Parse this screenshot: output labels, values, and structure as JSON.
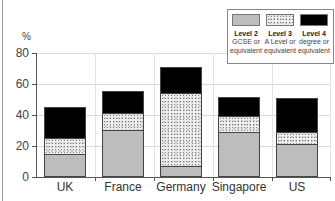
{
  "chart_data": {
    "type": "bar",
    "stacked": true,
    "title": "",
    "xlabel": "",
    "ylabel": "%",
    "ylim": [
      0,
      80
    ],
    "yticks": [
      0,
      20,
      40,
      60,
      80
    ],
    "grid": true,
    "legend_position": "top-right",
    "categories": [
      "UK",
      "France",
      "Germany",
      "Singapore",
      "US"
    ],
    "series": [
      {
        "name": "Level 2 GCSE or equivalent",
        "values": [
          15,
          30,
          7,
          29,
          21
        ],
        "color": "#bdbdbd",
        "pattern": "solid"
      },
      {
        "name": "Level 3 A Level or equivalent",
        "values": [
          10,
          11,
          47,
          10,
          8
        ],
        "color": "#eeeeee",
        "pattern": "stipple"
      },
      {
        "name": "Level 4 degree or equivalent",
        "values": [
          20,
          14,
          17,
          12,
          22
        ],
        "color": "#000000",
        "pattern": "solid"
      }
    ]
  },
  "axis": {
    "unit": "%",
    "yticks": [
      "0",
      "20",
      "40",
      "60",
      "80"
    ]
  },
  "legend": [
    {
      "title": "Level 2",
      "line1": "GCSE or",
      "line2": "equivalent"
    },
    {
      "title": "Level 3",
      "line1": "A Level or",
      "line2": "equivalent"
    },
    {
      "title": "Level 4",
      "line1": "degree or",
      "line2": "equivalent"
    }
  ],
  "categories": [
    "UK",
    "France",
    "Germany",
    "Singapore",
    "US"
  ]
}
